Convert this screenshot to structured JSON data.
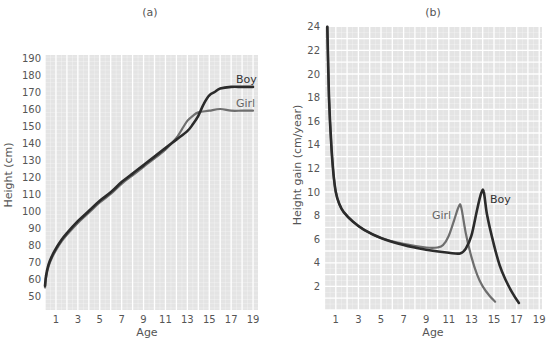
{
  "chart_data": [
    {
      "type": "line",
      "title": "(a)",
      "xlabel": "Age",
      "ylabel": "Height (cm)",
      "xticks": [
        1,
        3,
        5,
        7,
        9,
        11,
        13,
        15,
        17,
        19
      ],
      "yticks": [
        50,
        60,
        70,
        80,
        90,
        100,
        110,
        120,
        130,
        140,
        150,
        160,
        170,
        180,
        190
      ],
      "xlim": [
        0,
        19.5
      ],
      "ylim": [
        45,
        192
      ],
      "grid": true,
      "series": [
        {
          "name": "Boy",
          "color": "#2b2b2b",
          "points": [
            [
              0,
              56
            ],
            [
              0.1,
              62
            ],
            [
              0.3,
              68
            ],
            [
              0.6,
              73
            ],
            [
              1,
              78
            ],
            [
              1.5,
              83
            ],
            [
              2,
              87
            ],
            [
              3,
              94
            ],
            [
              4,
              100
            ],
            [
              5,
              106
            ],
            [
              6,
              111
            ],
            [
              7,
              117
            ],
            [
              8,
              122
            ],
            [
              9,
              127
            ],
            [
              10,
              132
            ],
            [
              11,
              137
            ],
            [
              12,
              142
            ],
            [
              13,
              147
            ],
            [
              13.5,
              151
            ],
            [
              14,
              156
            ],
            [
              14.5,
              163
            ],
            [
              15,
              168
            ],
            [
              15.5,
              170
            ],
            [
              16,
              172
            ],
            [
              17,
              173
            ],
            [
              18,
              173
            ],
            [
              19,
              173
            ]
          ]
        },
        {
          "name": "Girl",
          "color": "#6e6e6e",
          "points": [
            [
              0,
              55
            ],
            [
              0.1,
              61
            ],
            [
              0.3,
              67
            ],
            [
              0.6,
              72
            ],
            [
              1,
              77
            ],
            [
              1.5,
              82
            ],
            [
              2,
              86
            ],
            [
              3,
              93
            ],
            [
              4,
              99
            ],
            [
              5,
              105
            ],
            [
              6,
              110
            ],
            [
              7,
              116
            ],
            [
              8,
              121
            ],
            [
              9,
              126
            ],
            [
              10,
              131
            ],
            [
              11,
              136
            ],
            [
              12,
              143
            ],
            [
              12.5,
              148
            ],
            [
              13,
              153
            ],
            [
              13.5,
              156
            ],
            [
              14,
              158
            ],
            [
              15,
              159
            ],
            [
              16,
              160
            ],
            [
              17,
              159
            ],
            [
              18,
              159
            ],
            [
              19,
              159
            ]
          ]
        }
      ]
    },
    {
      "type": "line",
      "title": "(b)",
      "xlabel": "Age",
      "ylabel": "Height gain (cm/year)",
      "xticks": [
        1,
        3,
        5,
        7,
        9,
        11,
        13,
        15,
        17,
        19
      ],
      "yticks": [
        2,
        4,
        6,
        8,
        10,
        12,
        14,
        16,
        18,
        20,
        22,
        24
      ],
      "xlim": [
        0,
        19.2
      ],
      "ylim": [
        0,
        24
      ],
      "grid": true,
      "series": [
        {
          "name": "Boy",
          "color": "#2b2b2b",
          "points": [
            [
              0.25,
              24
            ],
            [
              0.4,
              18
            ],
            [
              0.6,
              14
            ],
            [
              0.8,
              11.5
            ],
            [
              1,
              10
            ],
            [
              1.3,
              9
            ],
            [
              1.7,
              8.3
            ],
            [
              2.5,
              7.5
            ],
            [
              3.5,
              6.8
            ],
            [
              5,
              6.1
            ],
            [
              7,
              5.5
            ],
            [
              9,
              5.1
            ],
            [
              11,
              4.85
            ],
            [
              12,
              4.8
            ],
            [
              12.5,
              5.2
            ],
            [
              13,
              6.3
            ],
            [
              13.5,
              8.5
            ],
            [
              13.9,
              10
            ],
            [
              14.1,
              10
            ],
            [
              14.4,
              8
            ],
            [
              15,
              5.5
            ],
            [
              15.5,
              3.8
            ],
            [
              16,
              2.6
            ],
            [
              16.6,
              1.5
            ],
            [
              17.2,
              0.6
            ]
          ]
        },
        {
          "name": "Girl",
          "color": "#6e6e6e",
          "points": [
            [
              0.25,
              24
            ],
            [
              0.4,
              18
            ],
            [
              0.6,
              14
            ],
            [
              0.8,
              11.5
            ],
            [
              1,
              10
            ],
            [
              1.3,
              9
            ],
            [
              1.7,
              8.3
            ],
            [
              2.5,
              7.5
            ],
            [
              3.5,
              6.8
            ],
            [
              5,
              6.1
            ],
            [
              7,
              5.6
            ],
            [
              9,
              5.3
            ],
            [
              10,
              5.3
            ],
            [
              10.5,
              5.5
            ],
            [
              11,
              6.3
            ],
            [
              11.5,
              7.7
            ],
            [
              11.9,
              8.8
            ],
            [
              12.1,
              8.7
            ],
            [
              12.5,
              6.5
            ],
            [
              13,
              4.5
            ],
            [
              13.5,
              3.0
            ],
            [
              14,
              2.0
            ],
            [
              14.6,
              1.2
            ],
            [
              15.1,
              0.7
            ]
          ]
        }
      ]
    }
  ]
}
